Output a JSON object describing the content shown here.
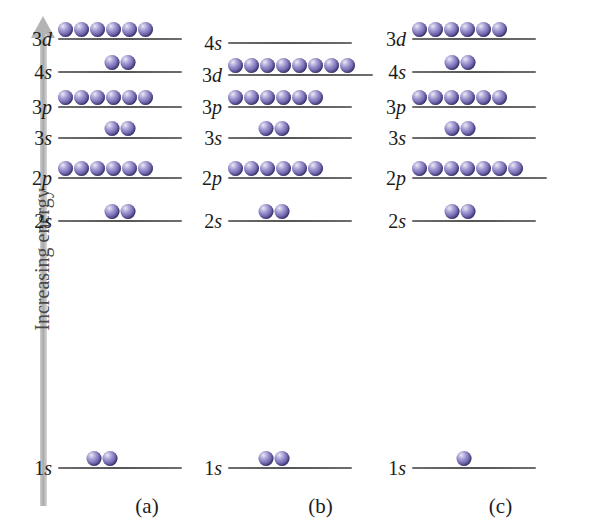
{
  "axis": {
    "label": "Increasing energy",
    "direction": "up",
    "arrow_color": "#b4b4b4"
  },
  "electron_color": "#6f66ae",
  "columns": [
    {
      "caption": "(a)",
      "levels": [
        {
          "n": "3",
          "orbital": "d",
          "label": "3d",
          "electrons": 6,
          "y": 40,
          "line_left": 0,
          "line_width": 124,
          "e_align": "left",
          "e_offset": 0
        },
        {
          "n": "4",
          "orbital": "s",
          "label": "4s",
          "electrons": 2,
          "y": 73,
          "line_left": 0,
          "line_width": 124,
          "e_align": "center",
          "e_offset": 0
        },
        {
          "n": "3",
          "orbital": "p",
          "label": "3p",
          "electrons": 6,
          "y": 108,
          "line_left": 0,
          "line_width": 124,
          "e_align": "left",
          "e_offset": 0
        },
        {
          "n": "3",
          "orbital": "s",
          "label": "3s",
          "electrons": 2,
          "y": 139,
          "line_left": 0,
          "line_width": 124,
          "e_align": "center",
          "e_offset": 0
        },
        {
          "n": "2",
          "orbital": "p",
          "label": "2p",
          "electrons": 6,
          "y": 179,
          "line_left": 0,
          "line_width": 124,
          "e_align": "left",
          "e_offset": 0
        },
        {
          "n": "2",
          "orbital": "s",
          "label": "2s",
          "electrons": 2,
          "y": 222,
          "line_left": 0,
          "line_width": 124,
          "e_align": "center",
          "e_offset": 0
        },
        {
          "n": "1",
          "orbital": "s",
          "label": "1s",
          "electrons": 2,
          "y": 469,
          "line_left": 0,
          "line_width": 124,
          "e_align": "center",
          "e_offset": -18
        }
      ]
    },
    {
      "caption": "(b)",
      "levels": [
        {
          "n": "4",
          "orbital": "s",
          "label": "4s",
          "electrons": 0,
          "y": 44,
          "line_left": 0,
          "line_width": 124,
          "e_align": "left",
          "e_offset": 0
        },
        {
          "n": "3",
          "orbital": "d",
          "label": "3d",
          "electrons": 8,
          "y": 76,
          "line_left": 0,
          "line_width": 145,
          "e_align": "left",
          "e_offset": 0
        },
        {
          "n": "3",
          "orbital": "p",
          "label": "3p",
          "electrons": 6,
          "y": 108,
          "line_left": 0,
          "line_width": 124,
          "e_align": "left",
          "e_offset": 0
        },
        {
          "n": "3",
          "orbital": "s",
          "label": "3s",
          "electrons": 2,
          "y": 139,
          "line_left": 0,
          "line_width": 124,
          "e_align": "center",
          "e_offset": -16
        },
        {
          "n": "2",
          "orbital": "p",
          "label": "2p",
          "electrons": 6,
          "y": 179,
          "line_left": 0,
          "line_width": 124,
          "e_align": "left",
          "e_offset": 0
        },
        {
          "n": "2",
          "orbital": "s",
          "label": "2s",
          "electrons": 2,
          "y": 222,
          "line_left": 0,
          "line_width": 124,
          "e_align": "center",
          "e_offset": -16
        },
        {
          "n": "1",
          "orbital": "s",
          "label": "1s",
          "electrons": 2,
          "y": 469,
          "line_left": 0,
          "line_width": 124,
          "e_align": "center",
          "e_offset": -16
        }
      ]
    },
    {
      "caption": "(c)",
      "levels": [
        {
          "n": "3",
          "orbital": "d",
          "label": "3d",
          "electrons": 6,
          "y": 40,
          "line_left": 0,
          "line_width": 124,
          "e_align": "left",
          "e_offset": 0
        },
        {
          "n": "4",
          "orbital": "s",
          "label": "4s",
          "electrons": 2,
          "y": 73,
          "line_left": 0,
          "line_width": 124,
          "e_align": "center",
          "e_offset": -14
        },
        {
          "n": "3",
          "orbital": "p",
          "label": "3p",
          "electrons": 6,
          "y": 108,
          "line_left": 0,
          "line_width": 124,
          "e_align": "left",
          "e_offset": 0
        },
        {
          "n": "3",
          "orbital": "s",
          "label": "3s",
          "electrons": 2,
          "y": 139,
          "line_left": 0,
          "line_width": 124,
          "e_align": "center",
          "e_offset": -14
        },
        {
          "n": "2",
          "orbital": "p",
          "label": "2p",
          "electrons": 7,
          "y": 179,
          "line_left": 0,
          "line_width": 135,
          "e_align": "left",
          "e_offset": 0
        },
        {
          "n": "2",
          "orbital": "s",
          "label": "2s",
          "electrons": 2,
          "y": 222,
          "line_left": 0,
          "line_width": 124,
          "e_align": "center",
          "e_offset": -14
        },
        {
          "n": "1",
          "orbital": "s",
          "label": "1s",
          "electrons": 1,
          "y": 469,
          "line_left": 0,
          "line_width": 124,
          "e_align": "center",
          "e_offset": -10
        }
      ]
    }
  ]
}
